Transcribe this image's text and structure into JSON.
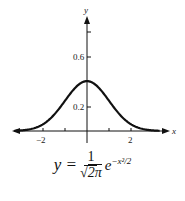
{
  "chart_data": {
    "type": "line",
    "title": "",
    "xlabel": "x",
    "ylabel": "y",
    "xlim": [
      -3.3,
      3.5
    ],
    "ylim": [
      0,
      0.88
    ],
    "x_ticks": [
      -2,
      -1,
      1,
      2
    ],
    "x_tick_labels": [
      "-2",
      "2"
    ],
    "y_ticks": [
      0.2,
      0.6,
      0.8
    ],
    "y_tick_labels": [
      "0.2",
      "0.6"
    ],
    "grid": false,
    "legend": null,
    "series": [
      {
        "name": "standard normal density",
        "x": [
          -3,
          -2.5,
          -2,
          -1.5,
          -1,
          -0.5,
          0,
          0.5,
          1,
          1.5,
          2,
          2.5,
          3
        ],
        "y": [
          0.004,
          0.018,
          0.054,
          0.13,
          0.242,
          0.352,
          0.399,
          0.352,
          0.242,
          0.13,
          0.054,
          0.018,
          0.004
        ]
      }
    ],
    "annotation": "y = (1/√(2π)) e^(−x²/2)"
  },
  "labels": {
    "x_axis": "x",
    "y_axis": "y",
    "tick_neg2": "−2",
    "tick_pos2": "2",
    "tick_02": "0.2",
    "tick_06": "0.6"
  },
  "formula": {
    "lhs": "y =",
    "numerator": "1",
    "denominator": "2π",
    "exp_base": "e",
    "exponent": "−x²/2"
  }
}
